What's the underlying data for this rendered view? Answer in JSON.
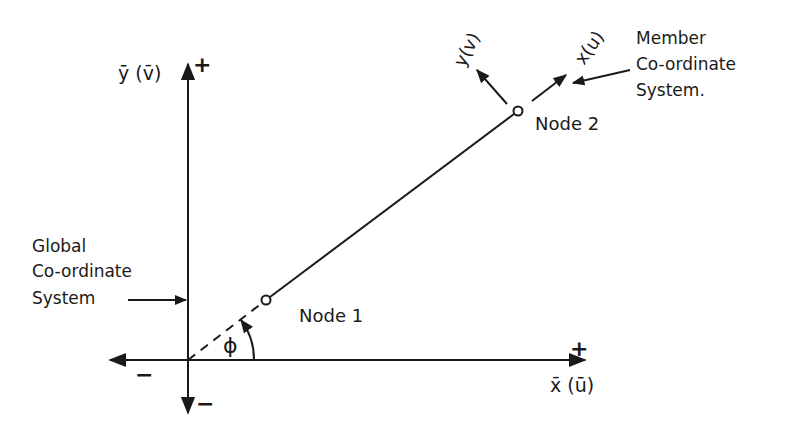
{
  "diagram": {
    "global_system": {
      "label_lines": [
        "Global",
        "Co-ordinate",
        "System"
      ],
      "x_axis_label": "x̄ (ū)",
      "y_axis_label": "ȳ (v̄)",
      "x_positive": "+",
      "x_negative": "−",
      "y_positive": "+",
      "y_negative": "−"
    },
    "member_system": {
      "label_lines": [
        "Member",
        "Co-ordinate",
        "System."
      ],
      "x_axis_label": "x(u)",
      "y_axis_label": "y(v)"
    },
    "nodes": [
      {
        "id": "node-1",
        "label": "Node 1"
      },
      {
        "id": "node-2",
        "label": "Node 2"
      }
    ],
    "angle_label": "ϕ",
    "colors": {
      "ink": "#1a1a1a",
      "background": "#ffffff"
    }
  }
}
